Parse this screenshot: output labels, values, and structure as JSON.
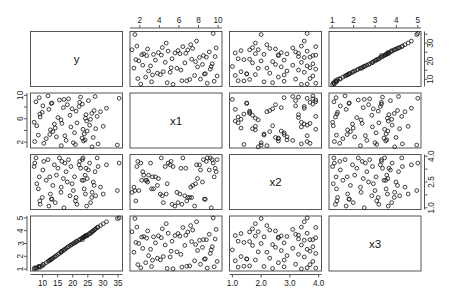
{
  "plot": {
    "type": "scatterplot-matrix",
    "variables": [
      "y",
      "x1",
      "x2",
      "x3"
    ],
    "diagonal_labels": {
      "d0": "y",
      "d1": "x1",
      "d2": "x2",
      "d3": "x3"
    },
    "point_symbol": "open-circle",
    "point_color": "#1d1d1d",
    "frame_color": "#555555",
    "background_color": "#ffffff",
    "n_points": 70
  },
  "axes": {
    "y": {
      "label": "y",
      "range": [
        6.0,
        36.5
      ],
      "ticks": [
        10,
        15,
        20,
        25,
        30,
        35
      ],
      "tick_labels": [
        "10",
        "15",
        "20",
        "25",
        "30",
        "35"
      ],
      "side_bottom": "column-1-bottom",
      "right_ticks": [
        10,
        20,
        30
      ],
      "right_tick_labels": [
        "10",
        "20",
        "30"
      ]
    },
    "x1": {
      "label": "x1",
      "range": [
        1.0,
        10.4
      ],
      "ticks": [
        2,
        4,
        6,
        8,
        10
      ],
      "tick_labels": [
        "2",
        "4",
        "6",
        "8",
        "10"
      ],
      "left_ticks": [
        2,
        6,
        10
      ],
      "left_tick_labels": [
        "2",
        "6",
        "10"
      ]
    },
    "x2": {
      "label": "x2",
      "range": [
        0.9,
        4.1
      ],
      "ticks": [
        1.0,
        2.0,
        3.0,
        4.0
      ],
      "tick_labels": [
        "1.0",
        "2.0",
        "3.0",
        "4.0"
      ],
      "right_ticks": [
        1.0,
        2.5,
        4.0
      ],
      "right_tick_labels": [
        "1.0",
        "2.5",
        "4.0"
      ]
    },
    "x3": {
      "label": "x3",
      "range": [
        0.85,
        5.15
      ],
      "ticks": [
        1,
        2,
        3,
        4,
        5
      ],
      "tick_labels": [
        "1",
        "2",
        "3",
        "4",
        "5"
      ],
      "left_ticks": [
        1,
        2,
        3,
        4,
        5
      ],
      "left_tick_labels": [
        "1",
        "2",
        "3",
        "4",
        "5"
      ]
    }
  },
  "chart_data": {
    "type": "scatter",
    "title": "",
    "xlabel": "",
    "ylabel": "",
    "matrix": true,
    "variables": [
      "y",
      "x1",
      "x2",
      "x3"
    ],
    "axis_ranges": {
      "y": [
        6.0,
        36.5
      ],
      "x1": [
        1.0,
        10.4
      ],
      "x2": [
        0.9,
        4.1
      ],
      "x3": [
        0.85,
        5.15
      ]
    },
    "tick_labels": {
      "y": [
        "10",
        "15",
        "20",
        "25",
        "30",
        "35"
      ],
      "y_right": [
        "10",
        "20",
        "30"
      ],
      "x1": [
        "2",
        "4",
        "6",
        "8",
        "10"
      ],
      "x1_left": [
        "2",
        "6",
        "10"
      ],
      "x2": [
        "1.0",
        "2.0",
        "3.0",
        "4.0"
      ],
      "x2_right": [
        "1.0",
        "2.5",
        "4.0"
      ],
      "x3": [
        "1",
        "2",
        "3",
        "4",
        "5"
      ],
      "x3_left": [
        "1",
        "2",
        "3",
        "4",
        "5"
      ]
    },
    "grid": false,
    "legend": "none",
    "correlations": {
      "y_x1": 0.02,
      "y_x2": -0.03,
      "y_x3": 0.95,
      "x1_x2": 0.01,
      "x1_x3": 0.02,
      "x2_x3": -0.01
    },
    "data": {
      "y": [
        8.1,
        7.4,
        9.2,
        7.8,
        8.6,
        9.9,
        7.2,
        8.9,
        10.4,
        9.1,
        11.2,
        10.1,
        12.6,
        11.8,
        13.4,
        12.1,
        13.9,
        14.6,
        12.9,
        15.1,
        16.2,
        15.6,
        14.2,
        16.9,
        17.4,
        16.1,
        18.2,
        17.8,
        19.1,
        18.6,
        20.2,
        19.4,
        21.1,
        20.6,
        22.3,
        21.4,
        23.1,
        22.6,
        24.2,
        23.4,
        19.8,
        20.9,
        22.1,
        23.8,
        24.6,
        25.2,
        24.1,
        26.3,
        25.6,
        27.1,
        26.4,
        23.2,
        24.8,
        25.9,
        27.4,
        26.8,
        28.1,
        27.6,
        29.2,
        28.4,
        13.1,
        12.4,
        16.4,
        17.1,
        23.6,
        24.4,
        30.1,
        31.2,
        34.8,
        35.4
      ],
      "x1": [
        4.8,
        2.1,
        6.3,
        8.9,
        3.2,
        7.1,
        5.4,
        9.6,
        1.8,
        6.8,
        2.6,
        8.2,
        4.1,
        9.9,
        3.8,
        7.6,
        5.1,
        2.9,
        8.6,
        6.2,
        1.4,
        9.2,
        4.4,
        7.9,
        3.1,
        5.8,
        8.4,
        2.3,
        6.6,
        9.4,
        1.9,
        4.6,
        7.3,
        3.6,
        8.8,
        5.3,
        2.7,
        9.7,
        6.1,
        4.2,
        7.7,
        1.6,
        8.1,
        3.4,
        5.6,
        9.1,
        2.4,
        6.9,
        4.9,
        7.4,
        1.2,
        8.5,
        3.9,
        5.9,
        9.8,
        2.8,
        6.4,
        4.3,
        7.2,
        1.7,
        8.7,
        3.3,
        5.2,
        9.3,
        2.2,
        6.7,
        4.7,
        7.8,
        1.5,
        9.5
      ],
      "x2": [
        2.4,
        3.6,
        1.2,
        3.9,
        2.1,
        1.6,
        3.4,
        2.8,
        3.7,
        1.4,
        2.6,
        3.2,
        1.8,
        3.8,
        2.3,
        1.1,
        3.5,
        2.9,
        1.5,
        3.3,
        2.2,
        3.9,
        1.3,
        2.7,
        3.6,
        1.9,
        2.5,
        3.1,
        1.7,
        3.8,
        2.0,
        3.4,
        1.6,
        2.8,
        3.7,
        1.2,
        2.6,
        3.3,
        1.8,
        3.9,
        2.4,
        1.4,
        3.5,
        2.1,
        1.1,
        3.2,
        2.9,
        1.6,
        3.6,
        2.3,
        1.9,
        3.8,
        2.7,
        1.3,
        3.1,
        2.5,
        3.9,
        1.7,
        2.2,
        3.4,
        1.5,
        2.8,
        3.7,
        1.0,
        2.6,
        3.3,
        1.8,
        3.5,
        2.0,
        3.6
      ],
      "x3": [
        1.05,
        1.1,
        1.15,
        1.08,
        1.2,
        1.25,
        1.02,
        1.18,
        1.35,
        1.22,
        1.5,
        1.38,
        1.72,
        1.6,
        1.85,
        1.65,
        1.95,
        2.05,
        1.78,
        2.15,
        2.32,
        2.22,
        1.98,
        2.45,
        2.55,
        2.35,
        2.7,
        2.62,
        2.85,
        2.75,
        3.0,
        2.88,
        3.15,
        3.05,
        3.3,
        3.18,
        3.42,
        3.35,
        3.58,
        3.45,
        2.92,
        3.08,
        3.25,
        3.52,
        3.62,
        3.72,
        3.55,
        3.9,
        3.8,
        4.05,
        3.92,
        3.3,
        3.6,
        3.78,
        4.1,
        3.98,
        4.25,
        4.15,
        4.4,
        4.28,
        1.8,
        1.7,
        2.4,
        2.5,
        3.5,
        3.65,
        4.55,
        4.7,
        4.95,
        5.0
      ]
    }
  }
}
